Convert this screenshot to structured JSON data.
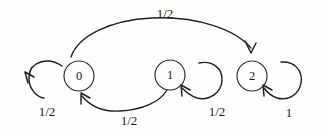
{
  "diagram": {
    "type": "markov-chain-state-diagram",
    "background_color": "#fdfdfd",
    "ink_color": "#1f1f1f",
    "states": [
      {
        "id": "0",
        "label": "0",
        "cx": 79,
        "cy": 76,
        "r": 15
      },
      {
        "id": "1",
        "label": "1",
        "cx": 170,
        "cy": 75,
        "r": 15
      },
      {
        "id": "2",
        "label": "2",
        "cx": 252,
        "cy": 76,
        "r": 15
      }
    ],
    "transitions": [
      {
        "name": "transition-0-to-2",
        "from": "0",
        "to": "2",
        "label": "1/2",
        "label_x": 165,
        "label_y": 13,
        "shape": "arc-over-top"
      },
      {
        "name": "transition-0-self",
        "from": "0",
        "to": "0",
        "label": "1/2",
        "label_x": 47,
        "label_y": 111,
        "shape": "self-loop-left"
      },
      {
        "name": "transition-1-to-0",
        "from": "1",
        "to": "0",
        "label": "1/2",
        "label_x": 129,
        "label_y": 120,
        "shape": "arc-under-bottom"
      },
      {
        "name": "transition-1-self",
        "from": "1",
        "to": "1",
        "label": "1/2",
        "label_x": 217,
        "label_y": 111,
        "shape": "self-loop-right"
      },
      {
        "name": "transition-2-self",
        "from": "2",
        "to": "2",
        "label": "1",
        "label_x": 289,
        "label_y": 112,
        "shape": "self-loop-right"
      }
    ]
  }
}
